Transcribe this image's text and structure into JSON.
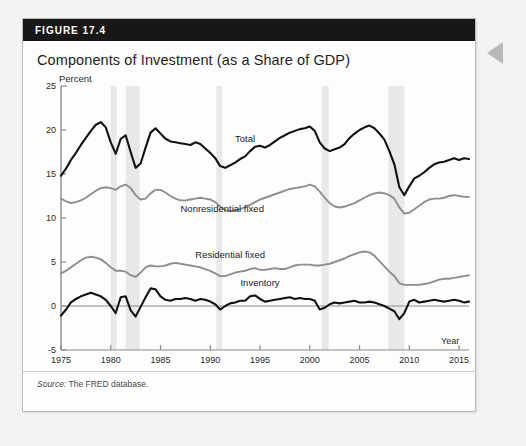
{
  "figure": {
    "header_label": "FIGURE 17.4",
    "title": "Components of Investment (as a Share of GDP)",
    "source_prefix": "Source:",
    "source_text": " The FRED database.",
    "side_arrow_icon": "left-pointing-triangle-icon"
  },
  "chart_data": {
    "type": "line",
    "title": "Components of Investment (as a Share of GDP)",
    "xlabel": "Year",
    "ylabel": "Percent",
    "ylim": [
      -5,
      25
    ],
    "xlim": [
      1975,
      2016
    ],
    "yticks": [
      -5,
      0,
      5,
      10,
      15,
      20,
      25
    ],
    "xticks": [
      1975,
      1980,
      1985,
      1990,
      1995,
      2000,
      2005,
      2010,
      2015
    ],
    "grid": false,
    "legend": "inline-annotations",
    "zero_line": 0,
    "recession_bands": [
      {
        "start": 1980.0,
        "end": 1980.6
      },
      {
        "start": 1981.5,
        "end": 1982.9
      },
      {
        "start": 1990.6,
        "end": 1991.2
      },
      {
        "start": 2001.2,
        "end": 2001.9
      },
      {
        "start": 2007.9,
        "end": 2009.5
      }
    ],
    "series": [
      {
        "name": "Total",
        "color": "#111111",
        "label_x": 1993.5,
        "label_y": 18.6,
        "x": [
          1975.0,
          1975.5,
          1976.0,
          1976.5,
          1977.0,
          1977.5,
          1978.0,
          1978.5,
          1979.0,
          1979.5,
          1980.0,
          1980.5,
          1981.0,
          1981.5,
          1982.0,
          1982.5,
          1983.0,
          1983.5,
          1984.0,
          1984.5,
          1985.0,
          1985.5,
          1986.0,
          1986.5,
          1987.0,
          1987.5,
          1988.0,
          1988.5,
          1989.0,
          1989.5,
          1990.0,
          1990.5,
          1991.0,
          1991.5,
          1992.0,
          1992.5,
          1993.0,
          1993.5,
          1994.0,
          1994.5,
          1995.0,
          1995.5,
          1996.0,
          1996.5,
          1997.0,
          1997.5,
          1998.0,
          1998.5,
          1999.0,
          1999.5,
          2000.0,
          2000.5,
          2001.0,
          2001.5,
          2002.0,
          2002.5,
          2003.0,
          2003.5,
          2004.0,
          2004.5,
          2005.0,
          2005.5,
          2006.0,
          2006.5,
          2007.0,
          2007.5,
          2008.0,
          2008.5,
          2009.0,
          2009.5,
          2010.0,
          2010.5,
          2011.0,
          2011.5,
          2012.0,
          2012.5,
          2013.0,
          2013.5,
          2014.0,
          2014.5,
          2015.0,
          2015.5,
          2016.0
        ],
        "y": [
          14.8,
          15.6,
          16.6,
          17.4,
          18.3,
          19.1,
          19.9,
          20.6,
          20.9,
          20.3,
          18.6,
          17.3,
          19.0,
          19.4,
          17.5,
          15.7,
          16.2,
          18.0,
          19.7,
          20.2,
          19.6,
          19.0,
          18.7,
          18.6,
          18.5,
          18.4,
          18.3,
          18.6,
          18.4,
          17.9,
          17.4,
          16.8,
          15.9,
          15.7,
          16.0,
          16.3,
          16.7,
          17.0,
          17.6,
          18.1,
          18.2,
          18.0,
          18.3,
          18.7,
          19.1,
          19.4,
          19.7,
          19.9,
          20.1,
          20.2,
          20.4,
          19.9,
          18.6,
          17.9,
          17.6,
          17.8,
          18.0,
          18.4,
          19.1,
          19.6,
          20.0,
          20.3,
          20.5,
          20.2,
          19.6,
          18.9,
          17.6,
          16.1,
          13.5,
          12.6,
          13.6,
          14.5,
          14.8,
          15.2,
          15.7,
          16.1,
          16.3,
          16.4,
          16.6,
          16.8,
          16.6,
          16.8,
          16.7
        ]
      },
      {
        "name": "Nonresidential fixed",
        "color": "#8e8e8e",
        "label_x": 1991.2,
        "label_y": 10.7,
        "x": [
          1975.0,
          1975.5,
          1976.0,
          1976.5,
          1977.0,
          1977.5,
          1978.0,
          1978.5,
          1979.0,
          1979.5,
          1980.0,
          1980.5,
          1981.0,
          1981.5,
          1982.0,
          1982.5,
          1983.0,
          1983.5,
          1984.0,
          1984.5,
          1985.0,
          1985.5,
          1986.0,
          1986.5,
          1987.0,
          1987.5,
          1988.0,
          1988.5,
          1989.0,
          1989.5,
          1990.0,
          1990.5,
          1991.0,
          1991.5,
          1992.0,
          1992.5,
          1993.0,
          1993.5,
          1994.0,
          1994.5,
          1995.0,
          1995.5,
          1996.0,
          1996.5,
          1997.0,
          1997.5,
          1998.0,
          1998.5,
          1999.0,
          1999.5,
          2000.0,
          2000.5,
          2001.0,
          2001.5,
          2002.0,
          2002.5,
          2003.0,
          2003.5,
          2004.0,
          2004.5,
          2005.0,
          2005.5,
          2006.0,
          2006.5,
          2007.0,
          2007.5,
          2008.0,
          2008.5,
          2009.0,
          2009.5,
          2010.0,
          2010.5,
          2011.0,
          2011.5,
          2012.0,
          2012.5,
          2013.0,
          2013.5,
          2014.0,
          2014.5,
          2015.0,
          2015.5,
          2016.0
        ],
        "y": [
          12.2,
          11.9,
          11.7,
          11.8,
          12.0,
          12.3,
          12.7,
          13.1,
          13.4,
          13.5,
          13.4,
          13.2,
          13.6,
          13.8,
          13.4,
          12.6,
          12.1,
          12.2,
          12.8,
          13.2,
          13.2,
          12.9,
          12.5,
          12.2,
          12.0,
          12.0,
          12.1,
          12.2,
          12.3,
          12.2,
          12.1,
          11.8,
          11.3,
          10.9,
          10.8,
          10.9,
          11.0,
          11.2,
          11.5,
          11.8,
          12.1,
          12.3,
          12.5,
          12.7,
          12.9,
          13.1,
          13.3,
          13.4,
          13.5,
          13.6,
          13.8,
          13.6,
          13.0,
          12.3,
          11.7,
          11.3,
          11.2,
          11.3,
          11.5,
          11.7,
          12.0,
          12.3,
          12.6,
          12.8,
          12.9,
          12.8,
          12.6,
          12.2,
          11.2,
          10.5,
          10.6,
          11.0,
          11.4,
          11.8,
          12.1,
          12.2,
          12.2,
          12.3,
          12.5,
          12.6,
          12.5,
          12.4,
          12.4
        ]
      },
      {
        "name": "Residential fixed",
        "color": "#8e8e8e",
        "label_x": 1992.0,
        "label_y": 5.4,
        "x": [
          1975.0,
          1975.5,
          1976.0,
          1976.5,
          1977.0,
          1977.5,
          1978.0,
          1978.5,
          1979.0,
          1979.5,
          1980.0,
          1980.5,
          1981.0,
          1981.5,
          1982.0,
          1982.5,
          1983.0,
          1983.5,
          1984.0,
          1984.5,
          1985.0,
          1985.5,
          1986.0,
          1986.5,
          1987.0,
          1987.5,
          1988.0,
          1988.5,
          1989.0,
          1989.5,
          1990.0,
          1990.5,
          1991.0,
          1991.5,
          1992.0,
          1992.5,
          1993.0,
          1993.5,
          1994.0,
          1994.5,
          1995.0,
          1995.5,
          1996.0,
          1996.5,
          1997.0,
          1997.5,
          1998.0,
          1998.5,
          1999.0,
          1999.5,
          2000.0,
          2000.5,
          2001.0,
          2001.5,
          2002.0,
          2002.5,
          2003.0,
          2003.5,
          2004.0,
          2004.5,
          2005.0,
          2005.5,
          2006.0,
          2006.5,
          2007.0,
          2007.5,
          2008.0,
          2008.5,
          2009.0,
          2009.5,
          2010.0,
          2010.5,
          2011.0,
          2011.5,
          2012.0,
          2012.5,
          2013.0,
          2013.5,
          2014.0,
          2014.5,
          2015.0,
          2015.5,
          2016.0
        ],
        "y": [
          3.7,
          4.0,
          4.4,
          4.8,
          5.2,
          5.5,
          5.6,
          5.5,
          5.3,
          4.9,
          4.4,
          4.0,
          4.0,
          3.9,
          3.5,
          3.3,
          3.8,
          4.4,
          4.6,
          4.5,
          4.5,
          4.6,
          4.8,
          4.9,
          4.8,
          4.7,
          4.6,
          4.5,
          4.4,
          4.2,
          4.0,
          3.7,
          3.4,
          3.4,
          3.6,
          3.8,
          3.9,
          4.0,
          4.2,
          4.3,
          4.1,
          4.1,
          4.2,
          4.3,
          4.2,
          4.2,
          4.4,
          4.6,
          4.7,
          4.7,
          4.7,
          4.6,
          4.6,
          4.7,
          4.8,
          5.0,
          5.2,
          5.4,
          5.7,
          5.9,
          6.1,
          6.2,
          6.1,
          5.7,
          5.1,
          4.5,
          3.9,
          3.4,
          2.6,
          2.4,
          2.4,
          2.4,
          2.4,
          2.5,
          2.6,
          2.8,
          3.0,
          3.1,
          3.1,
          3.2,
          3.3,
          3.4,
          3.5
        ]
      },
      {
        "name": "Inventory",
        "color": "#111111",
        "label_x": 1995.0,
        "label_y": 2.3,
        "x": [
          1975.0,
          1975.5,
          1976.0,
          1976.5,
          1977.0,
          1977.5,
          1978.0,
          1978.5,
          1979.0,
          1979.5,
          1980.0,
          1980.5,
          1981.0,
          1981.5,
          1982.0,
          1982.5,
          1983.0,
          1983.5,
          1984.0,
          1984.5,
          1985.0,
          1985.5,
          1986.0,
          1986.5,
          1987.0,
          1987.5,
          1988.0,
          1988.5,
          1989.0,
          1989.5,
          1990.0,
          1990.5,
          1991.0,
          1991.5,
          1992.0,
          1992.5,
          1993.0,
          1993.5,
          1994.0,
          1994.5,
          1995.0,
          1995.5,
          1996.0,
          1996.5,
          1997.0,
          1997.5,
          1998.0,
          1998.5,
          1999.0,
          1999.5,
          2000.0,
          2000.5,
          2001.0,
          2001.5,
          2002.0,
          2002.5,
          2003.0,
          2003.5,
          2004.0,
          2004.5,
          2005.0,
          2005.5,
          2006.0,
          2006.5,
          2007.0,
          2007.5,
          2008.0,
          2008.5,
          2009.0,
          2009.5,
          2010.0,
          2010.5,
          2011.0,
          2011.5,
          2012.0,
          2012.5,
          2013.0,
          2013.5,
          2014.0,
          2014.5,
          2015.0,
          2015.5,
          2016.0
        ],
        "y": [
          -1.1,
          -0.4,
          0.4,
          0.8,
          1.1,
          1.3,
          1.5,
          1.3,
          1.1,
          0.7,
          0.0,
          -0.8,
          1.0,
          1.1,
          -0.5,
          -1.2,
          -0.1,
          1.0,
          2.0,
          1.9,
          1.1,
          0.7,
          0.6,
          0.8,
          0.8,
          0.9,
          0.8,
          0.6,
          0.8,
          0.7,
          0.5,
          0.2,
          -0.4,
          0.0,
          0.3,
          0.4,
          0.6,
          0.6,
          1.1,
          1.2,
          0.8,
          0.5,
          0.6,
          0.7,
          0.8,
          0.9,
          1.0,
          0.8,
          0.9,
          0.8,
          0.8,
          0.6,
          -0.4,
          -0.2,
          0.2,
          0.4,
          0.3,
          0.4,
          0.5,
          0.6,
          0.4,
          0.4,
          0.5,
          0.4,
          0.2,
          0.0,
          -0.3,
          -0.6,
          -1.5,
          -0.8,
          0.5,
          0.7,
          0.4,
          0.5,
          0.6,
          0.7,
          0.6,
          0.5,
          0.6,
          0.7,
          0.6,
          0.4,
          0.5
        ]
      }
    ]
  }
}
